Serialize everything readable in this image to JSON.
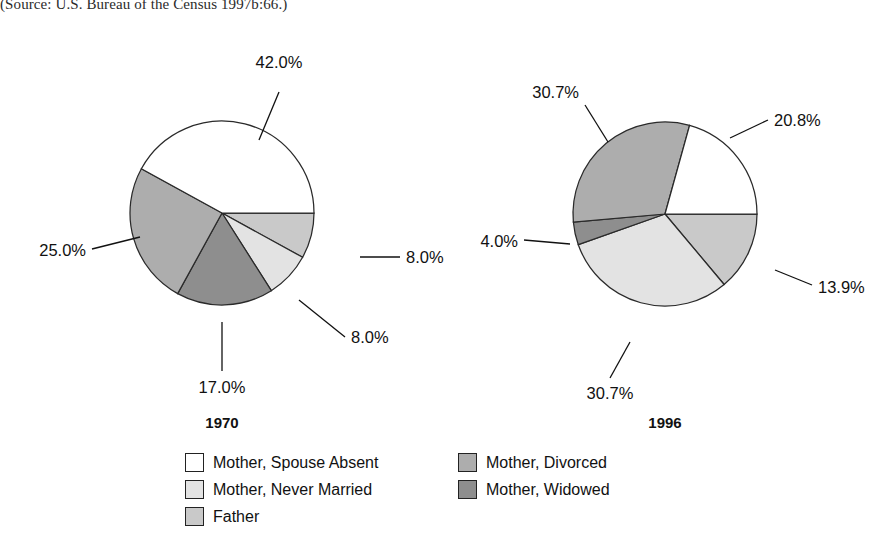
{
  "source_note": "(Source: U.S. Bureau of the Census 1997b:66.)",
  "chart_data": {
    "type": "pie",
    "title": "",
    "legend_position": "bottom",
    "categories": [
      "Mother, Spouse Absent",
      "Mother, Never Married",
      "Father",
      "Mother, Divorced",
      "Mother, Widowed"
    ],
    "colors": {
      "Mother, Spouse Absent": "#ffffff",
      "Mother, Never Married": "#e3e3e3",
      "Father": "#c9c9c9",
      "Mother, Divorced": "#adadad",
      "Mother, Widowed": "#8e8e8e"
    },
    "series": [
      {
        "name": "1970",
        "values": [
          42.0,
          8.0,
          8.0,
          25.0,
          17.0
        ],
        "labels": [
          "42.0%",
          "8.0%",
          "8.0%",
          "25.0%",
          "17.0%"
        ]
      },
      {
        "name": "1996",
        "values": [
          20.8,
          30.7,
          13.9,
          30.7,
          4.0
        ],
        "labels": [
          "20.8%",
          "30.7%",
          "13.9%",
          "30.7%",
          "4.0%"
        ]
      }
    ]
  },
  "pies": [
    {
      "year_label": "1970",
      "center_x": 222,
      "center_y": 213,
      "radius": 92,
      "year_x": 222,
      "year_y": 428,
      "slices": [
        {
          "name": "Father",
          "value": "8.0%",
          "color": "#c9c9c9",
          "a0": 0,
          "a1": 28.8,
          "lx1": 360,
          "ly1": 257,
          "lx2": 400,
          "ly2": 257,
          "tx": 406,
          "ty": 263,
          "anchor": "start"
        },
        {
          "name": "Mother, Never Married",
          "value": "8.0%",
          "color": "#e3e3e3",
          "a0": 28.8,
          "a1": 57.6,
          "lx1": 299,
          "ly1": 300,
          "lx2": 345,
          "ly2": 337,
          "tx": 351,
          "ty": 343,
          "anchor": "start"
        },
        {
          "name": "Mother, Widowed",
          "value": "17.0%",
          "color": "#8e8e8e",
          "a0": 57.6,
          "a1": 118.8,
          "lx1": 222,
          "ly1": 322,
          "lx2": 222,
          "ly2": 371,
          "tx": 222,
          "ty": 393,
          "anchor": "middle"
        },
        {
          "name": "Mother, Divorced",
          "value": "25.0%",
          "color": "#adadad",
          "a0": 118.8,
          "a1": 208.8,
          "lx1": 140,
          "ly1": 237,
          "lx2": 92,
          "ly2": 249,
          "tx": 86,
          "ty": 256,
          "anchor": "end"
        },
        {
          "name": "Mother, Spouse Absent",
          "value": "42.0%",
          "color": "#ffffff",
          "a0": 208.8,
          "a1": 360,
          "lx1": 259,
          "ly1": 140,
          "lx2": 279,
          "ly2": 92,
          "tx": 279,
          "ty": 68,
          "anchor": "middle"
        }
      ]
    },
    {
      "year_label": "1996",
      "center_x": 665,
      "center_y": 214,
      "radius": 92,
      "year_x": 665,
      "year_y": 428,
      "slices": [
        {
          "name": "Father",
          "value": "13.9%",
          "color": "#c9c9c9",
          "a0": 0,
          "a1": 50.0,
          "lx1": 775,
          "ly1": 270,
          "lx2": 812,
          "ly2": 285,
          "tx": 818,
          "ty": 293,
          "anchor": "start"
        },
        {
          "name": "Mother, Never Married",
          "value": "30.7%",
          "color": "#e3e3e3",
          "a0": 50.0,
          "a1": 160.5,
          "lx1": 630,
          "ly1": 342,
          "lx2": 610,
          "ly2": 378,
          "tx": 610,
          "ty": 399,
          "anchor": "middle"
        },
        {
          "name": "Mother, Widowed",
          "value": "4.0%",
          "color": "#8e8e8e",
          "a0": 160.5,
          "a1": 175.0,
          "lx1": 570,
          "ly1": 244,
          "lx2": 524,
          "ly2": 240,
          "tx": 518,
          "ty": 247,
          "anchor": "end"
        },
        {
          "name": "Mother, Divorced",
          "value": "30.7%",
          "color": "#adadad",
          "a0": 175.0,
          "a1": 285.5,
          "lx1": 608,
          "ly1": 142,
          "lx2": 585,
          "ly2": 105,
          "tx": 579,
          "ty": 98,
          "anchor": "end"
        },
        {
          "name": "Mother, Spouse Absent",
          "value": "20.8%",
          "color": "#ffffff",
          "a0": 285.5,
          "a1": 360,
          "lx1": 730,
          "ly1": 138,
          "lx2": 768,
          "ly2": 120,
          "tx": 774,
          "ty": 126,
          "anchor": "start"
        }
      ]
    }
  ],
  "legend": {
    "left_column": [
      {
        "label": "Mother, Spouse Absent",
        "color": "#ffffff"
      },
      {
        "label": "Mother, Never Married",
        "color": "#e3e3e3"
      },
      {
        "label": "Father",
        "color": "#c9c9c9"
      }
    ],
    "right_column": [
      {
        "label": "Mother, Divorced",
        "color": "#adadad"
      },
      {
        "label": "Mother, Widowed",
        "color": "#8e8e8e"
      }
    ]
  }
}
